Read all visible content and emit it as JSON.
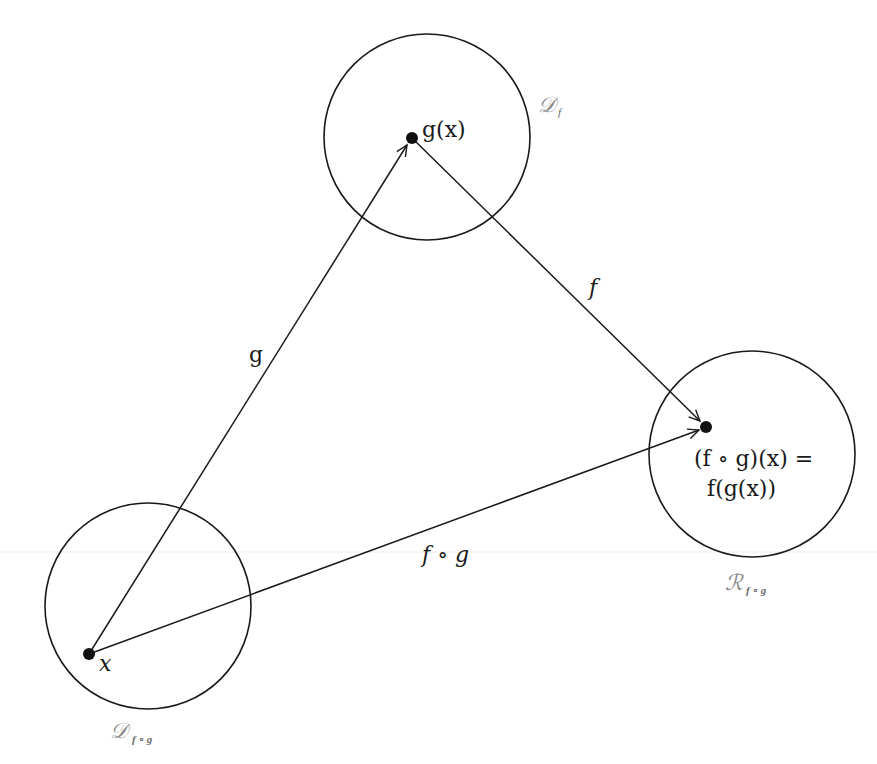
{
  "diagram": {
    "colors": {
      "background": "#ffffff",
      "stroke": "#1a1a1a",
      "set_label": "#8a8a8a"
    },
    "sets": [
      {
        "id": "domain-f",
        "label_main": "𝒟",
        "label_sub": "f",
        "circle": {
          "cx": 427,
          "cy": 137,
          "r": 103
        },
        "label_pos": {
          "x": 540,
          "y": 112
        }
      },
      {
        "id": "range-fog",
        "label_main": "ℛ",
        "label_sub": "f ∘ g",
        "circle": {
          "cx": 752,
          "cy": 454,
          "r": 103
        },
        "label_pos": {
          "x": 726,
          "y": 590
        }
      },
      {
        "id": "domain-fog",
        "label_main": "𝒟",
        "label_sub": "f ∘ g",
        "circle": {
          "cx": 148,
          "cy": 606,
          "r": 103
        },
        "label_pos": {
          "x": 111,
          "y": 740
        }
      }
    ],
    "points": [
      {
        "id": "x",
        "label": "x",
        "cx": 89,
        "cy": 654
      },
      {
        "id": "gx",
        "label": "g(x)",
        "cx": 412,
        "cy": 138
      },
      {
        "id": "fgx",
        "label_line1": "(f ∘ g)(x) =",
        "label_line2": "f(g(x))",
        "cx": 706,
        "cy": 427
      }
    ],
    "arrows": [
      {
        "id": "g",
        "label": "g",
        "from": "x",
        "to": "gx"
      },
      {
        "id": "f",
        "label": "f",
        "from": "gx",
        "to": "fgx"
      },
      {
        "id": "fog",
        "label": "f ∘ g",
        "from": "x",
        "to": "fgx"
      }
    ]
  }
}
